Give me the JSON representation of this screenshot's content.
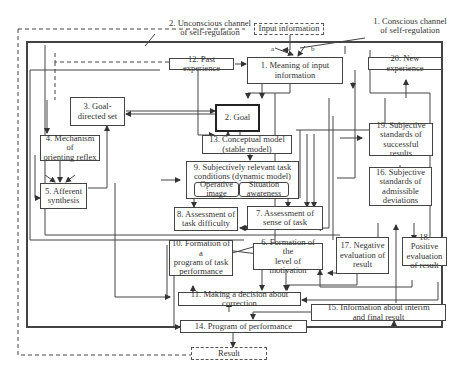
{
  "channels": {
    "unconscious": "2. Unconscious channel\nof self-regulation",
    "conscious": "1. Conscious channel\nof self-regulation",
    "a": "a",
    "b": "b"
  },
  "terminals": {
    "input": "Input information",
    "result": "Result"
  },
  "nodes": {
    "n1": "1. Meaning of input\ninformation",
    "n2": "2. Goal",
    "n3": "3. Goal-\ndirected set",
    "n4": "4. Mechanism of\norienting reflex",
    "n5": "5. Afferent\nsynthesis",
    "n6": "6. Formation of the\nlevel of motivation",
    "n7": "7. Assessment of\nsense of task",
    "n8": "8. Assessment of\ntask difficulty",
    "n9": "9. Subjectively relevant task\nconditions (dynamic model)",
    "n9a": "Operative\nimage",
    "n9b": "Situation\nawareness",
    "n10": "10. Formation of a\nprogram of task\nperformance",
    "n11": "11. Making a decision about correction",
    "n12": "12. Past experience",
    "n13": "13. Conceptual model\n(stable model)",
    "n14": "14. Program of performance",
    "n15": "15. Information about interim\nand final result",
    "n16": "16. Subjective\nstandards of\nadmissible\ndeviations",
    "n17": "17. Negative\nevaluation of\nresult",
    "n18": "18. Positive\nevaluation\nof result",
    "n19": "19. Subjective\nstandards of\nsuccessful results",
    "n20": "20. New experience"
  },
  "colors": {
    "line": "#444444",
    "background": "#ffffff"
  }
}
